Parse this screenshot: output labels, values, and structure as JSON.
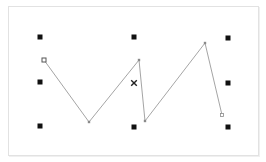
{
  "canvas": {
    "width": 266,
    "height": 162,
    "frame": {
      "x": 8,
      "y": 6,
      "w": 249,
      "h": 148,
      "border_color": "#e2e2e2"
    }
  },
  "colors": {
    "grid_marker": "#111111",
    "line": "#9a9a9a",
    "vertex": "#8a8a8a",
    "start_vertex_stroke": "#555555",
    "cross_marker": "#222222"
  },
  "grid_markers": [
    {
      "id": "tl",
      "x": 40,
      "y": 37
    },
    {
      "id": "tc",
      "x": 134,
      "y": 37
    },
    {
      "id": "tr",
      "x": 228,
      "y": 38
    },
    {
      "id": "ml",
      "x": 40,
      "y": 82
    },
    {
      "id": "mr",
      "x": 228,
      "y": 83
    },
    {
      "id": "bl",
      "x": 40,
      "y": 126
    },
    {
      "id": "bc",
      "x": 134,
      "y": 127
    },
    {
      "id": "br",
      "x": 228,
      "y": 127
    }
  ],
  "center_marker": {
    "type": "cross",
    "x": 134,
    "y": 83
  },
  "polyline": {
    "points": [
      {
        "x": 44,
        "y": 60,
        "kind": "start"
      },
      {
        "x": 89,
        "y": 122,
        "kind": "vertex"
      },
      {
        "x": 139,
        "y": 60,
        "kind": "vertex"
      },
      {
        "x": 145,
        "y": 121,
        "kind": "vertex"
      },
      {
        "x": 205,
        "y": 43,
        "kind": "vertex"
      },
      {
        "x": 222,
        "y": 115,
        "kind": "end"
      }
    ]
  }
}
